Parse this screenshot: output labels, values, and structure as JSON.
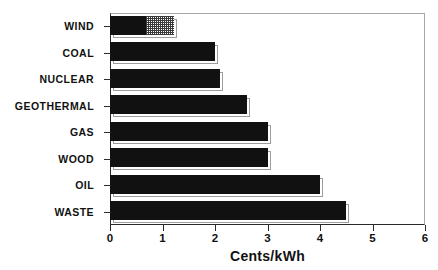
{
  "chart_data": {
    "type": "bar",
    "orientation": "horizontal",
    "title": "",
    "subtitle": "",
    "xlabel": "Cents/kWh",
    "ylabel": "",
    "xlim": [
      0,
      6
    ],
    "xticks": [
      0,
      1,
      2,
      3,
      4,
      5,
      6
    ],
    "xticklabels": [
      "0",
      "1",
      "2",
      "3",
      "4",
      "5",
      "6"
    ],
    "grid": false,
    "legend": null,
    "categories": [
      "WIND",
      "COAL",
      "NUCLEAR",
      "GEOTHERMAL",
      "GAS",
      "WOOD",
      "OIL",
      "WASTE"
    ],
    "values": [
      1.22,
      2.0,
      2.1,
      2.6,
      3.0,
      3.0,
      4.0,
      4.5
    ],
    "bars": [
      {
        "category": "WIND",
        "total": 1.22,
        "segments": [
          {
            "name": "solid",
            "value": 0.67,
            "fill": "solid"
          },
          {
            "name": "hatched",
            "value": 0.55,
            "fill": "hatch"
          }
        ]
      },
      {
        "category": "COAL",
        "total": 2.0,
        "segments": [
          {
            "name": "solid",
            "value": 2.0,
            "fill": "solid"
          }
        ]
      },
      {
        "category": "NUCLEAR",
        "total": 2.1,
        "segments": [
          {
            "name": "solid",
            "value": 2.1,
            "fill": "solid"
          }
        ]
      },
      {
        "category": "GEOTHERMAL",
        "total": 2.6,
        "segments": [
          {
            "name": "solid",
            "value": 2.6,
            "fill": "solid"
          }
        ]
      },
      {
        "category": "GAS",
        "total": 3.0,
        "segments": [
          {
            "name": "solid",
            "value": 3.0,
            "fill": "solid"
          }
        ]
      },
      {
        "category": "WOOD",
        "total": 3.0,
        "segments": [
          {
            "name": "solid",
            "value": 3.0,
            "fill": "solid"
          }
        ]
      },
      {
        "category": "OIL",
        "total": 4.0,
        "segments": [
          {
            "name": "solid",
            "value": 4.0,
            "fill": "solid"
          }
        ]
      },
      {
        "category": "WASTE",
        "total": 4.5,
        "segments": [
          {
            "name": "solid",
            "value": 4.5,
            "fill": "solid"
          }
        ]
      }
    ],
    "colors": {
      "bar_solid": "#111111",
      "bar_hatch_line": "#3a3a3a",
      "bar_hatch_bg": "#ffffff",
      "axis": "#2b2b2b",
      "frame": "#a8a8a8",
      "text": "#111111",
      "background": "#ffffff"
    }
  },
  "axis": {
    "x_title": "Cents/kWh"
  }
}
